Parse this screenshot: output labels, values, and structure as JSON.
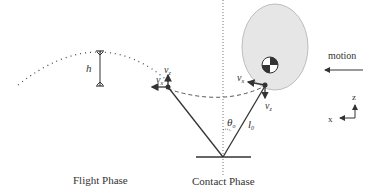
{
  "diagram": {
    "captions": {
      "flight_phase": "Flight Phase",
      "contact_phase": "Contact Phase"
    },
    "labels": {
      "height": "h",
      "vz_flight": "v",
      "vz_flight_sub": "z",
      "vx_flight": "v",
      "vx_flight_sub": "x",
      "vx_contact": "v",
      "vx_contact_sub": "x",
      "vz_contact": "v",
      "vz_contact_sub": "z",
      "theta": "θ",
      "theta_sub": "o",
      "leg_length": "l",
      "leg_length_sub": "0",
      "motion": "motion",
      "axis_z": "z",
      "axis_x": "x"
    },
    "colors": {
      "body_fill": "#e6e6e6",
      "body_stroke": "#bdbdbd",
      "line": "#333333"
    }
  }
}
